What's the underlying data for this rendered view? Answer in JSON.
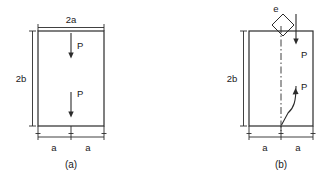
{
  "figure": {
    "type": "engineering-diagram",
    "background_color": "#ffffff",
    "line_color": "#2b2b2b"
  },
  "panels": [
    {
      "id": "a",
      "caption": "(a)",
      "shape": "rectangle",
      "rect": {
        "x": 38,
        "y": 31,
        "width": 66,
        "height": 95
      },
      "dimensions": {
        "top": {
          "label": "2a",
          "x": 71,
          "y": 20
        },
        "left": {
          "label": "2b",
          "x": 20,
          "y": 80
        },
        "bottom": [
          {
            "label": "a",
            "x": 54,
            "y": 149
          },
          {
            "label": "a",
            "x": 88,
            "y": 149
          }
        ]
      },
      "forces": [
        {
          "label": "P",
          "direction": "down",
          "x": 71,
          "y_start": 33,
          "y_end": 58,
          "label_x": 78,
          "label_y": 48,
          "style": "straight"
        },
        {
          "label": "P",
          "direction": "down",
          "x": 71,
          "y_start": 92,
          "y_end": 117,
          "label_x": 78,
          "label_y": 95,
          "style": "straight"
        }
      ],
      "centerline": false,
      "eccentric_marker": null
    },
    {
      "id": "b",
      "caption": "(b)",
      "shape": "rectangle",
      "rect": {
        "x": 249,
        "y": 31,
        "width": 64,
        "height": 95
      },
      "dimensions": {
        "top": null,
        "left": {
          "label": "2b",
          "x": 231,
          "y": 80
        },
        "bottom": [
          {
            "label": "a",
            "x": 265,
            "y": 149
          },
          {
            "label": "a",
            "x": 298,
            "y": 149
          }
        ]
      },
      "forces": [
        {
          "label": "P",
          "direction": "down",
          "x": 296,
          "y_start": 14,
          "y_end": 44,
          "label_x": 301,
          "label_y": 56,
          "style": "straight"
        },
        {
          "label": "P",
          "direction": "down-curved",
          "x": 296,
          "y_start": 86,
          "y_end": 126,
          "label_x": 301,
          "label_y": 88,
          "style": "curved"
        }
      ],
      "centerline": true,
      "eccentric_marker": {
        "label": "e",
        "shape": "diamond",
        "label_x": 276,
        "label_y": 9,
        "center_x": 283,
        "center_y": 24,
        "half_diagonal": 11
      }
    }
  ]
}
